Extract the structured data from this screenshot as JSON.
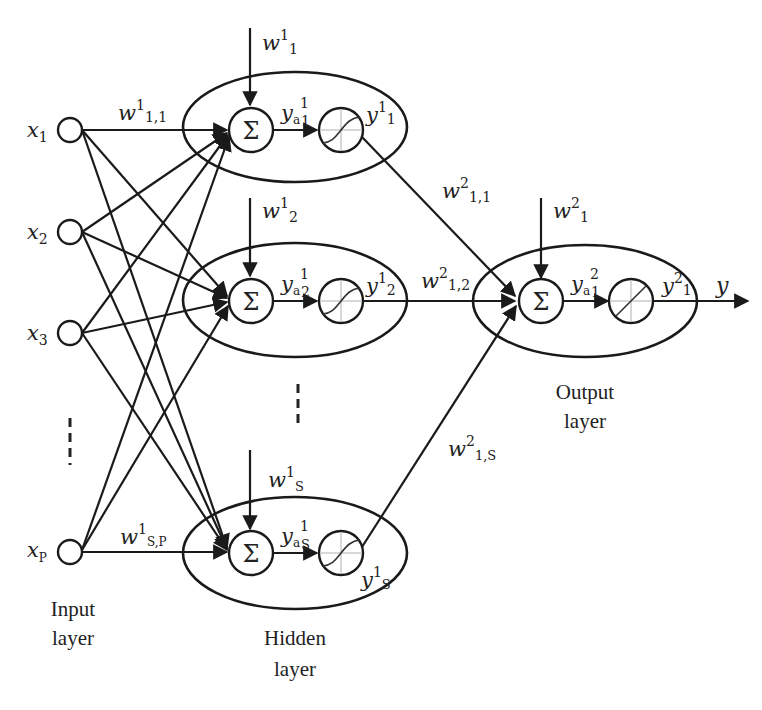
{
  "diagram": {
    "type": "feedforward-neural-network",
    "layers": {
      "input": {
        "caption_line1": "Input",
        "caption_line2": "layer",
        "nodes": [
          {
            "var": "x",
            "sub": "1"
          },
          {
            "var": "x",
            "sub": "2"
          },
          {
            "var": "x",
            "sub": "3"
          },
          {
            "var": "x",
            "sub": "P"
          }
        ]
      },
      "hidden": {
        "caption_line1": "Hidden",
        "caption_line2": "layer",
        "neurons": [
          {
            "bias": {
              "var": "w",
              "sup": "1",
              "sub": "1"
            },
            "sum_symbol": "Σ",
            "activation_input": {
              "var": "y",
              "sub_a": "a",
              "sup": "1",
              "sub": "1"
            },
            "activation": "sigmoid",
            "output": {
              "var": "y",
              "sup": "1",
              "sub": "1"
            }
          },
          {
            "bias": {
              "var": "w",
              "sup": "1",
              "sub": "2"
            },
            "sum_symbol": "Σ",
            "activation_input": {
              "var": "y",
              "sub_a": "a",
              "sup": "1",
              "sub": "2"
            },
            "activation": "sigmoid",
            "output": {
              "var": "y",
              "sup": "1",
              "sub": "2"
            }
          },
          {
            "bias": {
              "var": "w",
              "sup": "1",
              "sub": "S"
            },
            "sum_symbol": "Σ",
            "activation_input": {
              "var": "y",
              "sub_a": "a",
              "sup": "1",
              "sub": "S"
            },
            "activation": "sigmoid",
            "output": {
              "var": "y",
              "sup": "1",
              "sub": "S"
            }
          }
        ]
      },
      "output": {
        "caption_line1": "Output",
        "caption_line2": "layer",
        "neuron": {
          "bias": {
            "var": "w",
            "sup": "2",
            "sub": "1"
          },
          "sum_symbol": "Σ",
          "activation_input": {
            "var": "y",
            "sub_a": "a",
            "sup": "2",
            "sub": "1"
          },
          "activation": "linear",
          "output": {
            "var": "y",
            "sup": "2",
            "sub": "1"
          }
        },
        "final_output": "y"
      }
    },
    "weights": {
      "input_hidden_first": {
        "var": "w",
        "sup": "1",
        "sub": "1,1"
      },
      "input_hidden_last": {
        "var": "w",
        "sup": "1",
        "sub": "S,P"
      },
      "hidden_output": [
        {
          "var": "w",
          "sup": "2",
          "sub": "1,1"
        },
        {
          "var": "w",
          "sup": "2",
          "sub": "1,2"
        },
        {
          "var": "w",
          "sup": "2",
          "sub": "1,S"
        }
      ]
    },
    "colors": {
      "line": "#1a1a1a",
      "background": "#ffffff",
      "grid": "#b0b0b0"
    }
  }
}
